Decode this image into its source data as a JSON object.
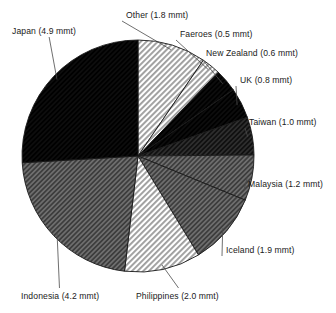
{
  "chart_data": {
    "type": "pie",
    "title": "",
    "subtitle": "",
    "xlabel": "",
    "ylabel": "",
    "units": "mmt",
    "total": 18.9,
    "legend_position": "none",
    "grid": false,
    "start_angle_deg": 0,
    "direction": "clockwise",
    "categories": [
      "Other",
      "Faeroes",
      "New Zealand",
      "UK",
      "Taiwan",
      "Malaysia",
      "Iceland",
      "Philippines",
      "Indonesia",
      "Japan"
    ],
    "values": [
      1.8,
      0.5,
      0.6,
      0.8,
      1.0,
      1.2,
      1.9,
      2.0,
      4.2,
      4.9
    ],
    "labels": [
      "Other (1.8 mmt)",
      "Faeroes (0.5 mmt)",
      "New Zealand (0.6 mmt)",
      "UK (0.8 mmt)",
      "Taiwan (1.0 mmt)",
      "Malaysia (1.2 mmt)",
      "Iceland (1.9 mmt)",
      "Philippines (2.0 mmt)",
      "Indonesia (4.2 mmt)",
      "Japan (4.9 mmt)"
    ],
    "slice_fills": [
      "light-gray-hatch",
      "light-gray-hatch",
      "black",
      "black",
      "dark-gray-hatch",
      "mid-gray-hatch",
      "mid-gray-hatch",
      "light-gray-hatch",
      "mid-gray-hatch",
      "black"
    ],
    "colors": {
      "outline": "#1a1a1a",
      "black": "#0d0d0d",
      "dark_gray": "#3a3a3a",
      "mid_gray": "#7a7a7a",
      "light_gray": "#c9c9c9",
      "background": "#ffffff",
      "leader_line": "#4a4a4a",
      "label_text": "#1a1a1a"
    },
    "geometry": {
      "center_x": 138,
      "center_y": 156,
      "radius": 116
    }
  },
  "labels_layout": [
    {
      "key": "japan",
      "text": "Japan (4.9 mmt)",
      "x": 12,
      "y": 27,
      "anchor": "start"
    },
    {
      "key": "other",
      "text": "Other (1.8 mmt)",
      "x": 126,
      "y": 11,
      "anchor": "start"
    },
    {
      "key": "faeroes",
      "text": "Faeroes (0.5 mmt)",
      "x": 180,
      "y": 30,
      "anchor": "start"
    },
    {
      "key": "new_zealand",
      "text": "New Zealand (0.6 mmt)",
      "x": 206,
      "y": 49,
      "anchor": "start"
    },
    {
      "key": "uk",
      "text": "UK (0.8 mmt)",
      "x": 240,
      "y": 76,
      "anchor": "start"
    },
    {
      "key": "taiwan",
      "text": "Taiwan (1.0 mmt)",
      "x": 249,
      "y": 118,
      "anchor": "start"
    },
    {
      "key": "malaysia",
      "text": "Malaysia (1.2 mmt)",
      "x": 248,
      "y": 180,
      "anchor": "start"
    },
    {
      "key": "iceland",
      "text": "Iceland (1.9 mmt)",
      "x": 226,
      "y": 246,
      "anchor": "start"
    },
    {
      "key": "philippines",
      "text": "Philippines (2.0 mmt)",
      "x": 136,
      "y": 292,
      "anchor": "start"
    },
    {
      "key": "indonesia",
      "text": "Indonesia (4.2 mmt)",
      "x": 21,
      "y": 292,
      "anchor": "start"
    }
  ]
}
